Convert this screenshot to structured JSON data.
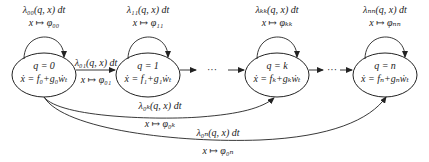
{
  "diagram": {
    "type": "state-transition",
    "nodes": [
      {
        "id": "q0",
        "state": "q = 0",
        "dynamics": "ẋ = f₀+g₀ẇₜ",
        "self_rate": "λ₀₀(q, x) dt",
        "self_map": "x ↦ φ₀₀"
      },
      {
        "id": "q1",
        "state": "q = 1",
        "dynamics": "ẋ = f₁+g₁ẇₜ",
        "self_rate": "λ₁₁(q, x) dt",
        "self_map": "x ↦ φ₁₁"
      },
      {
        "id": "qk",
        "state": "q = k",
        "dynamics": "ẋ = fₖ+gₖẇₜ",
        "self_rate": "λₖₖ(q, x) dt",
        "self_map": "x ↦ φₖₖ"
      },
      {
        "id": "qn",
        "state": "q = n",
        "dynamics": "ẋ = fₙ+gₙẇₜ",
        "self_rate": "λₙₙ(q, x) dt",
        "self_map": "x ↦ φₙₙ"
      }
    ],
    "edges": [
      {
        "from": "q0",
        "to": "q1",
        "rate": "λ₀₁(q, x) dt",
        "map": "x ↦ φ₀₁"
      },
      {
        "from": "q0",
        "to": "qk",
        "rate": "λ₀ₖ(q, x) dt",
        "map": "x ↦ φ₀ₖ"
      },
      {
        "from": "q0",
        "to": "qn",
        "rate": "λ₀ₙ(q, x) dt",
        "map": "x ↦ φ₀ₙ"
      }
    ],
    "ellipsis": "···"
  }
}
